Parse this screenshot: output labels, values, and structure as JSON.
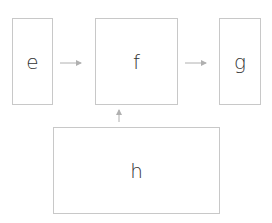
{
  "diagram": {
    "nodes": [
      {
        "id": "e",
        "label": "e"
      },
      {
        "id": "f",
        "label": "f"
      },
      {
        "id": "g",
        "label": "g"
      },
      {
        "id": "h",
        "label": "h"
      }
    ],
    "edges": [
      {
        "from": "e",
        "to": "f"
      },
      {
        "from": "f",
        "to": "g"
      },
      {
        "from": "h",
        "to": "f"
      }
    ],
    "colors": {
      "border": "#c8c8c8",
      "arrow": "#b0b0b0",
      "text": "#333333"
    }
  }
}
